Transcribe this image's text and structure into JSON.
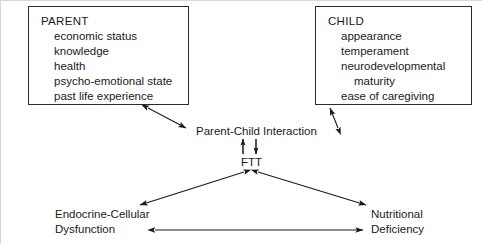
{
  "nodes": {
    "parent": {
      "title": "PARENT",
      "items": [
        "economic status",
        "knowledge",
        "health",
        "psycho-emotional state",
        "past life experience"
      ]
    },
    "child": {
      "title": "CHILD",
      "items": [
        "appearance",
        "temperament",
        "neurodevelopmental",
        "maturity",
        "ease of caregiving"
      ]
    },
    "interaction": {
      "label": "Parent-Child Interaction"
    },
    "ftt": {
      "label": "FTT"
    },
    "endocrine": {
      "line1": "Endocrine-Cellular",
      "line2": "Dysfunction"
    },
    "nutritional": {
      "line1": "Nutritional",
      "line2": "Deficiency"
    }
  },
  "edges": [
    {
      "id": "parent-interaction",
      "from": "parent",
      "to": "interaction",
      "direction": "bidirectional",
      "style": "diagonal"
    },
    {
      "id": "child-interaction",
      "from": "child",
      "to": "interaction",
      "direction": "bidirectional",
      "style": "diagonal"
    },
    {
      "id": "ftt-to-interaction",
      "from": "ftt",
      "to": "interaction",
      "direction": "up",
      "style": "vertical"
    },
    {
      "id": "interaction-to-ftt",
      "from": "interaction",
      "to": "ftt",
      "direction": "down",
      "style": "vertical"
    },
    {
      "id": "ftt-endocrine",
      "from": "ftt",
      "to": "endocrine",
      "direction": "bidirectional",
      "style": "diagonal"
    },
    {
      "id": "ftt-nutritional",
      "from": "ftt",
      "to": "nutritional",
      "direction": "bidirectional",
      "style": "diagonal"
    },
    {
      "id": "endocrine-nutritional",
      "from": "endocrine",
      "to": "nutritional",
      "direction": "bidirectional",
      "style": "horizontal"
    }
  ],
  "colors": {
    "ink": "#1a1a1a",
    "box_border": "#2b2b2b",
    "arrow": "#1a1a1a",
    "background": "#ffffff",
    "frame": "#d8d8d8"
  }
}
